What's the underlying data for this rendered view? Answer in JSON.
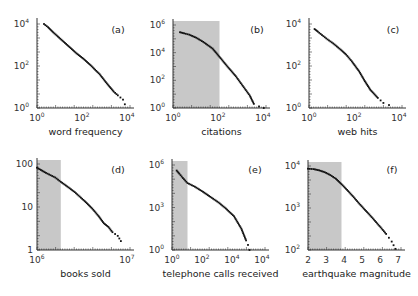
{
  "chart_data": [
    {
      "id": "a",
      "type": "scatter",
      "panel_label": "(a)",
      "xlabel": "word frequency",
      "ylabel": "",
      "xscale": "log",
      "yscale": "log",
      "xlim": [
        1,
        10000
      ],
      "ylim": [
        1,
        10000
      ],
      "xticks": [
        "10^0",
        "10^2",
        "10^4"
      ],
      "yticks": [
        "10^0",
        "10^2",
        "10^4"
      ],
      "shaded_region": null,
      "series": [
        {
          "name": "word frequency",
          "x": [
            2,
            3,
            5,
            10,
            20,
            50,
            100,
            200,
            500,
            1000,
            2000,
            3000,
            5000,
            6000
          ],
          "y": [
            10000,
            7000,
            4000,
            2000,
            1000,
            400,
            220,
            110,
            40,
            15,
            6,
            4,
            2.5,
            1.5
          ]
        }
      ]
    },
    {
      "id": "b",
      "type": "scatter",
      "panel_label": "(b)",
      "xlabel": "citations",
      "ylabel": "",
      "xscale": "log",
      "yscale": "log",
      "xlim": [
        1,
        10000
      ],
      "ylim": [
        1,
        1000000
      ],
      "xticks": [
        "10^0",
        "10^2",
        "10^4"
      ],
      "yticks": [
        "10^0",
        "10^2",
        "10^4",
        "10^6"
      ],
      "shaded_region": {
        "x": [
          1,
          100
        ]
      },
      "series": [
        {
          "name": "citations",
          "x": [
            2,
            3,
            5,
            10,
            20,
            50,
            100,
            200,
            500,
            1000,
            2000,
            3000,
            5000,
            8000
          ],
          "y": [
            300000,
            250000,
            200000,
            120000,
            60000,
            20000,
            5000,
            1200,
            200,
            40,
            8,
            2,
            1.3,
            1
          ]
        }
      ]
    },
    {
      "id": "c",
      "type": "scatter",
      "panel_label": "(c)",
      "xlabel": "web hits",
      "ylabel": "",
      "xscale": "log",
      "yscale": "log",
      "xlim": [
        1,
        100000
      ],
      "ylim": [
        1,
        100000
      ],
      "xticks": [
        "10^0",
        "10^2",
        "10^4"
      ],
      "yticks": [
        "10^0",
        "10^2",
        "10^4"
      ],
      "shaded_region": null,
      "series": [
        {
          "name": "web hits",
          "x": [
            2,
            3,
            5,
            10,
            20,
            50,
            100,
            200,
            500,
            1000,
            2000,
            5000,
            10000,
            20000
          ],
          "y": [
            50000,
            35000,
            22000,
            12000,
            7000,
            3000,
            1500,
            600,
            150,
            40,
            12,
            4,
            2,
            1.5
          ]
        }
      ]
    },
    {
      "id": "d",
      "type": "scatter",
      "panel_label": "(d)",
      "xlabel": "books sold",
      "ylabel": "",
      "xscale": "log",
      "yscale": "log",
      "xlim": [
        1000000,
        15000000
      ],
      "ylim": [
        1,
        800
      ],
      "xticks": [
        "10^6",
        "10^7"
      ],
      "yticks": [
        "1",
        "10",
        "100"
      ],
      "shaded_region": {
        "x": [
          1000000,
          2000000
        ]
      },
      "series": [
        {
          "name": "books sold",
          "x": [
            1000000,
            1300000,
            1700000,
            2000000,
            2500000,
            3000000,
            4000000,
            5000000,
            6000000,
            7000000,
            8000000,
            9000000,
            10500000,
            11500000
          ],
          "y": [
            600,
            400,
            280,
            200,
            130,
            90,
            45,
            25,
            14,
            8,
            6,
            4,
            3,
            2
          ]
        }
      ]
    },
    {
      "id": "e",
      "type": "scatter",
      "panel_label": "(e)",
      "xlabel": "telephone calls received",
      "ylabel": "",
      "xscale": "log",
      "yscale": "log",
      "xlim": [
        1,
        1000000
      ],
      "ylim": [
        1,
        100000000
      ],
      "xticks": [
        "10^0",
        "10^2",
        "10^4",
        "10^4"
      ],
      "yticks": [
        "10^0",
        "10^3",
        "10^6"
      ],
      "shaded_region": {
        "x": [
          1,
          10
        ]
      },
      "series": [
        {
          "name": "telephone calls received",
          "x": [
            2,
            3,
            5,
            10,
            30,
            100,
            300,
            1000,
            3000,
            10000,
            30000,
            60000,
            80000,
            100000
          ],
          "y": [
            30000000,
            15000000,
            6000000,
            2000000,
            900000,
            300000,
            100000,
            30000,
            8000,
            1500,
            100,
            8,
            3,
            1
          ]
        }
      ]
    },
    {
      "id": "f",
      "type": "scatter",
      "panel_label": "(f)",
      "xlabel": "earthquake magnitude",
      "ylabel": "",
      "xscale": "linear",
      "yscale": "log",
      "xlim": [
        2,
        7
      ],
      "ylim": [
        20,
        20000
      ],
      "xticks": [
        "2",
        "3",
        "4",
        "5",
        "6",
        "7"
      ],
      "yticks": [
        "10^2",
        "10^3",
        "10^4"
      ],
      "shaded_region": {
        "x": [
          2,
          3.8
        ]
      },
      "series": [
        {
          "name": "earthquake magnitude",
          "x": [
            2.0,
            2.3,
            2.6,
            2.9,
            3.2,
            3.5,
            3.8,
            4.1,
            4.4,
            4.7,
            5.0,
            5.3,
            5.6,
            5.9,
            6.2,
            6.5,
            6.7
          ],
          "y": [
            16000,
            15500,
            14000,
            12000,
            9500,
            7000,
            4500,
            2800,
            1700,
            1000,
            600,
            370,
            220,
            130,
            75,
            40,
            22
          ]
        }
      ]
    }
  ],
  "panels": {
    "a": {
      "label": "(a)",
      "xlabel": "word frequency",
      "xt": [
        [
          "10",
          "0"
        ],
        [
          "10",
          "2"
        ],
        [
          "10",
          "4"
        ]
      ],
      "yt": [
        [
          "10",
          "0"
        ],
        [
          "10",
          "2"
        ],
        [
          "10",
          "4"
        ]
      ]
    },
    "b": {
      "label": "(b)",
      "xlabel": "citations",
      "xt": [
        [
          "10",
          "0"
        ],
        [
          "10",
          "2"
        ],
        [
          "10",
          "4"
        ]
      ],
      "yt": [
        [
          "10",
          "0"
        ],
        [
          "10",
          "2"
        ],
        [
          "10",
          "4"
        ],
        [
          "10",
          "6"
        ]
      ]
    },
    "c": {
      "label": "(c)",
      "xlabel": "web hits",
      "xt": [
        [
          "10",
          "0"
        ],
        [
          "10",
          "2"
        ],
        [
          "10",
          "4"
        ]
      ],
      "yt": [
        [
          "10",
          "0"
        ],
        [
          "10",
          "2"
        ],
        [
          "10",
          "4"
        ]
      ]
    },
    "d": {
      "label": "(d)",
      "xlabel": "books sold",
      "xt": [
        [
          "10",
          "6"
        ],
        [
          "10",
          "7"
        ]
      ],
      "yt": [
        [
          "1",
          ""
        ],
        [
          "10",
          ""
        ],
        [
          "100",
          ""
        ]
      ]
    },
    "e": {
      "label": "(e)",
      "xlabel": "telephone calls received",
      "xt": [
        [
          "10",
          "0"
        ],
        [
          "10",
          "2"
        ],
        [
          "10",
          "4"
        ],
        [
          "10",
          "4"
        ]
      ],
      "yt": [
        [
          "10",
          "0"
        ],
        [
          "10",
          "3"
        ],
        [
          "10",
          "6"
        ]
      ]
    },
    "f": {
      "label": "(f)",
      "xlabel": "earthquake magnitude",
      "xt": [
        [
          "2",
          ""
        ],
        [
          "3",
          ""
        ],
        [
          "4",
          ""
        ],
        [
          "5",
          ""
        ],
        [
          "6",
          ""
        ],
        [
          "7",
          ""
        ]
      ],
      "yt": [
        [
          "10",
          "2"
        ],
        [
          "10",
          "3"
        ],
        [
          "10",
          "4"
        ]
      ]
    }
  },
  "colors": {
    "shade": "#c8c8c8",
    "points": "#111111",
    "axis": "#333333"
  }
}
